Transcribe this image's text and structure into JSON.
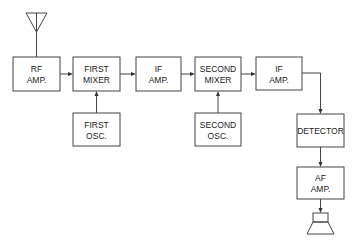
{
  "diagram": {
    "blocks": [
      {
        "id": "rf_amp",
        "lines": [
          "RF",
          "AMP."
        ]
      },
      {
        "id": "first_mixer",
        "lines": [
          "FIRST",
          "MIXER"
        ]
      },
      {
        "id": "if_amp_1",
        "lines": [
          "IF",
          "AMP."
        ]
      },
      {
        "id": "second_mixer",
        "lines": [
          "SECOND",
          "MIXER"
        ]
      },
      {
        "id": "if_amp_2",
        "lines": [
          "IF",
          "AMP."
        ]
      },
      {
        "id": "first_osc",
        "lines": [
          "FIRST",
          "OSC."
        ]
      },
      {
        "id": "second_osc",
        "lines": [
          "SECOND",
          "OSC."
        ]
      },
      {
        "id": "detector",
        "lines": [
          "DETECTOR"
        ]
      },
      {
        "id": "af_amp",
        "lines": [
          "AF",
          "AMP."
        ]
      }
    ],
    "connections": [
      {
        "from": "antenna",
        "to": "rf_amp"
      },
      {
        "from": "rf_amp",
        "to": "first_mixer"
      },
      {
        "from": "first_osc",
        "to": "first_mixer"
      },
      {
        "from": "first_mixer",
        "to": "if_amp_1"
      },
      {
        "from": "if_amp_1",
        "to": "second_mixer"
      },
      {
        "from": "second_osc",
        "to": "second_mixer"
      },
      {
        "from": "second_mixer",
        "to": "if_amp_2"
      },
      {
        "from": "if_amp_2",
        "to": "detector"
      },
      {
        "from": "detector",
        "to": "af_amp"
      },
      {
        "from": "af_amp",
        "to": "speaker"
      }
    ],
    "icons": {
      "antenna": "antenna-icon",
      "speaker": "speaker-icon"
    }
  }
}
